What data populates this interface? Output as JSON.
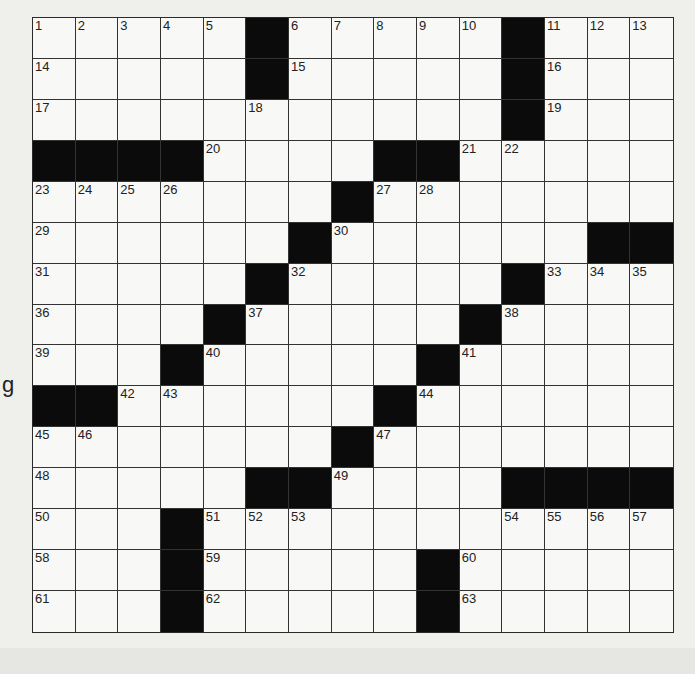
{
  "stray_text": "g",
  "grid": {
    "rows": 15,
    "cols": 15,
    "layout": [
      ".....#.....#...",
      ".....#.....#...",
      "...........#...",
      "####....##.....",
      ".......#.......",
      "......#......##",
      ".....#.....#...",
      "....#.....#....",
      "...#.....#.....",
      "##......#......",
      ".......#.......",
      ".....##....####",
      "...#...........",
      "...#.....#.....",
      "...#.....#....."
    ],
    "numbers": [
      {
        "r": 0,
        "c": 0,
        "n": "1"
      },
      {
        "r": 0,
        "c": 1,
        "n": "2"
      },
      {
        "r": 0,
        "c": 2,
        "n": "3"
      },
      {
        "r": 0,
        "c": 3,
        "n": "4"
      },
      {
        "r": 0,
        "c": 4,
        "n": "5"
      },
      {
        "r": 0,
        "c": 6,
        "n": "6"
      },
      {
        "r": 0,
        "c": 7,
        "n": "7"
      },
      {
        "r": 0,
        "c": 8,
        "n": "8"
      },
      {
        "r": 0,
        "c": 9,
        "n": "9"
      },
      {
        "r": 0,
        "c": 10,
        "n": "10"
      },
      {
        "r": 0,
        "c": 12,
        "n": "11"
      },
      {
        "r": 0,
        "c": 13,
        "n": "12"
      },
      {
        "r": 0,
        "c": 14,
        "n": "13"
      },
      {
        "r": 1,
        "c": 0,
        "n": "14"
      },
      {
        "r": 1,
        "c": 6,
        "n": "15"
      },
      {
        "r": 1,
        "c": 12,
        "n": "16"
      },
      {
        "r": 2,
        "c": 0,
        "n": "17"
      },
      {
        "r": 2,
        "c": 5,
        "n": "18"
      },
      {
        "r": 2,
        "c": 12,
        "n": "19"
      },
      {
        "r": 3,
        "c": 4,
        "n": "20"
      },
      {
        "r": 3,
        "c": 10,
        "n": "21"
      },
      {
        "r": 3,
        "c": 11,
        "n": "22"
      },
      {
        "r": 4,
        "c": 0,
        "n": "23"
      },
      {
        "r": 4,
        "c": 1,
        "n": "24"
      },
      {
        "r": 4,
        "c": 2,
        "n": "25"
      },
      {
        "r": 4,
        "c": 3,
        "n": "26"
      },
      {
        "r": 4,
        "c": 8,
        "n": "27"
      },
      {
        "r": 4,
        "c": 9,
        "n": "28"
      },
      {
        "r": 5,
        "c": 0,
        "n": "29"
      },
      {
        "r": 5,
        "c": 7,
        "n": "30"
      },
      {
        "r": 6,
        "c": 0,
        "n": "31"
      },
      {
        "r": 6,
        "c": 6,
        "n": "32"
      },
      {
        "r": 6,
        "c": 12,
        "n": "33"
      },
      {
        "r": 6,
        "c": 13,
        "n": "34"
      },
      {
        "r": 6,
        "c": 14,
        "n": "35"
      },
      {
        "r": 7,
        "c": 0,
        "n": "36"
      },
      {
        "r": 7,
        "c": 5,
        "n": "37"
      },
      {
        "r": 7,
        "c": 11,
        "n": "38"
      },
      {
        "r": 8,
        "c": 0,
        "n": "39"
      },
      {
        "r": 8,
        "c": 4,
        "n": "40"
      },
      {
        "r": 8,
        "c": 10,
        "n": "41"
      },
      {
        "r": 9,
        "c": 2,
        "n": "42"
      },
      {
        "r": 9,
        "c": 3,
        "n": "43"
      },
      {
        "r": 9,
        "c": 9,
        "n": "44"
      },
      {
        "r": 10,
        "c": 0,
        "n": "45"
      },
      {
        "r": 10,
        "c": 1,
        "n": "46"
      },
      {
        "r": 10,
        "c": 8,
        "n": "47"
      },
      {
        "r": 11,
        "c": 0,
        "n": "48"
      },
      {
        "r": 11,
        "c": 7,
        "n": "49"
      },
      {
        "r": 12,
        "c": 0,
        "n": "50"
      },
      {
        "r": 12,
        "c": 4,
        "n": "51"
      },
      {
        "r": 12,
        "c": 5,
        "n": "52"
      },
      {
        "r": 12,
        "c": 6,
        "n": "53"
      },
      {
        "r": 12,
        "c": 11,
        "n": "54"
      },
      {
        "r": 12,
        "c": 12,
        "n": "55"
      },
      {
        "r": 12,
        "c": 13,
        "n": "56"
      },
      {
        "r": 12,
        "c": 14,
        "n": "57"
      },
      {
        "r": 13,
        "c": 0,
        "n": "58"
      },
      {
        "r": 13,
        "c": 4,
        "n": "59"
      },
      {
        "r": 13,
        "c": 10,
        "n": "60"
      },
      {
        "r": 14,
        "c": 0,
        "n": "61"
      },
      {
        "r": 14,
        "c": 4,
        "n": "62"
      },
      {
        "r": 14,
        "c": 10,
        "n": "63"
      }
    ]
  },
  "colors": {
    "black_square": "#0b0b0b",
    "paper": "#f8f8f6",
    "grid_line": "#333333"
  }
}
